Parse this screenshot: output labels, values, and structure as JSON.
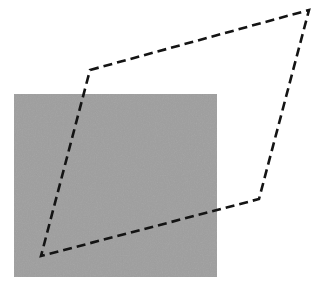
{
  "figure": {
    "title": "Dashed quadrilateral overlaid on a gray square",
    "canvas": {
      "width": 321,
      "height": 296,
      "background_color": "#ffffff"
    },
    "shapes": {
      "gray_square": {
        "label": "gray square region",
        "x": 14,
        "y": 94,
        "width": 203,
        "height": 183,
        "fill_color": "#969696",
        "noise_color_light": "#a2a2a2",
        "noise_color_dark": "#8b8b8b",
        "stroke": "none"
      },
      "quadrilateral": {
        "label": "dashed quadrilateral outline",
        "vertices": [
          {
            "name": "upper-left",
            "x": 90,
            "y": 70
          },
          {
            "name": "top-right",
            "x": 309,
            "y": 10
          },
          {
            "name": "lower-right",
            "x": 259,
            "y": 199
          },
          {
            "name": "bottom-left",
            "x": 41,
            "y": 256
          }
        ],
        "points_attr": "90,70 309,10 259,199 41,256",
        "stroke_color": "#141414",
        "stroke_width": 2.6,
        "dash_pattern": "9 5",
        "fill": "none",
        "closed": true
      }
    }
  },
  "chart_data": {
    "type": "scatter",
    "title": "Dashed quadrilateral overlaid on a gray square",
    "xlabel": "",
    "ylabel": "",
    "xlim": [
      0,
      321
    ],
    "ylim": [
      0,
      296
    ],
    "grid": false,
    "legend": "none",
    "annotations": [
      {
        "kind": "rectangle",
        "name": "gray-square",
        "x": 14,
        "y": 94,
        "width": 203,
        "height": 183,
        "fill": "#969696"
      },
      {
        "kind": "polygon",
        "name": "dashed-quadrilateral",
        "x": [
          90,
          309,
          259,
          41
        ],
        "y": [
          70,
          10,
          199,
          256
        ],
        "fill": "none",
        "edgecolor": "#141414",
        "linewidth": 2.6,
        "linestyle": "dashed"
      }
    ]
  }
}
